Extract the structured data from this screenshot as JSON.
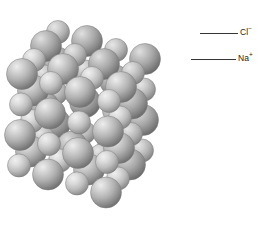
{
  "figure": {
    "name": "sodium-chloride-crystal-lattice",
    "background_color": "#ffffff"
  },
  "labels": [
    {
      "id": "chloride",
      "symbol": "Cl",
      "charge": "−",
      "text": "Cl−",
      "color": "#231f20",
      "leader": {
        "x1": 200,
        "y1": 33,
        "x2": 238,
        "y2": 33
      }
    },
    {
      "id": "sodium",
      "symbol": "Na",
      "charge": "+",
      "text": "Na+",
      "color": "#231f20",
      "leader": {
        "x1": 191,
        "y1": 59,
        "x2": 236,
        "y2": 59
      }
    }
  ],
  "sphere_style": {
    "highlight_color": "#e9e9e9",
    "mid_color": "#b0b0b0",
    "shadow_color": "#6e6e6e",
    "edge_color": "#7a7a7a",
    "light_direction": "upper-left"
  },
  "lattice": {
    "type": "face-centered-cubic-close-packed",
    "rows": 4,
    "columns": 4,
    "layers": 4,
    "large_radius_px": 15.5,
    "small_radius_px": 11.5,
    "extent": {
      "left": 8,
      "top": 16,
      "right": 206,
      "bottom": 216
    }
  }
}
